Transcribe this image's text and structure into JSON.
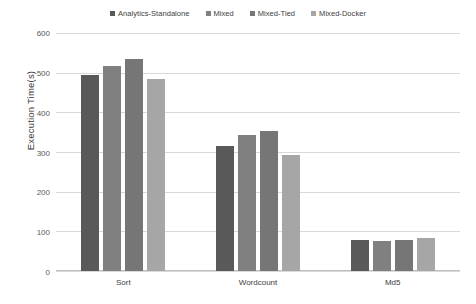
{
  "chart_data": {
    "type": "bar",
    "title": "",
    "xlabel": "",
    "ylabel": "Execution Time(s)",
    "categories": [
      "Sort",
      "Wordcount",
      "Md5"
    ],
    "ylim": [
      0,
      600
    ],
    "ytick_step": 100,
    "yticks": [
      600,
      500,
      400,
      300,
      200,
      100,
      0
    ],
    "ytick_labels": [
      "600",
      "500",
      "400",
      "300",
      "200",
      "100",
      "0"
    ],
    "grid": true,
    "legend_position": "top-center",
    "series": [
      {
        "name": "Analytics-Standalone",
        "color": "#595959",
        "values": [
          495,
          315,
          77
        ]
      },
      {
        "name": "Mixed",
        "color": "#808080",
        "values": [
          517,
          343,
          76
        ]
      },
      {
        "name": "Mixed-Tied",
        "color": "#767676",
        "values": [
          535,
          353,
          78
        ]
      },
      {
        "name": "Mixed-Docker",
        "color": "#a6a6a6",
        "values": [
          485,
          293,
          82
        ]
      }
    ]
  },
  "colors": {
    "background": "#ffffff",
    "gridline": "#d9d9d9",
    "axis": "#bfbfbf",
    "tick_text": "#595959",
    "label_text": "#404040"
  }
}
